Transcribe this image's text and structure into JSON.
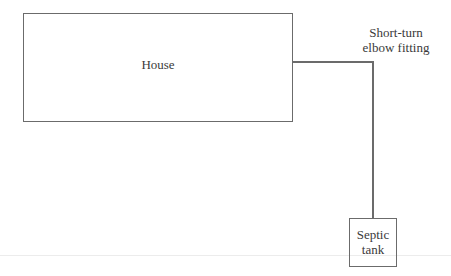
{
  "diagram": {
    "house": {
      "label": "House"
    },
    "fitting": {
      "label_line1": "Short-turn",
      "label_line2": "elbow fitting"
    },
    "tank": {
      "label_line1": "Septic",
      "label_line2": "tank"
    }
  },
  "colors": {
    "stroke": "#6b6b6b",
    "text": "#3a3a3a",
    "background": "#ffffff"
  }
}
